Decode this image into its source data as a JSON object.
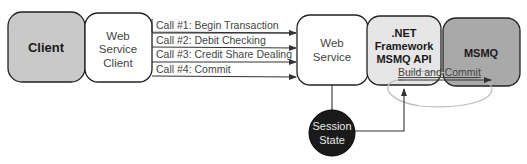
{
  "diagram": {
    "nodes": {
      "client": {
        "label": "Client",
        "fill": "#c9c9c9"
      },
      "ws_client": {
        "line1": "Web",
        "line2": "Service",
        "line3": "Client",
        "fill": "#ffffff"
      },
      "web_service": {
        "line1": "Web",
        "line2": "Service",
        "fill": "#ffffff"
      },
      "net_api": {
        "line1": ".NET",
        "line2": "Framework",
        "line3": "MSMQ API",
        "fill": "#e6e6e6"
      },
      "msmq": {
        "label": "MSMQ",
        "fill": "#a9a9a9"
      },
      "session_state": {
        "line1": "Session",
        "line2": "State",
        "fill": "#1a1a1a"
      }
    },
    "calls": [
      {
        "label": "Call #1: Begin Transaction"
      },
      {
        "label": "Call #2: Debit Checking"
      },
      {
        "label": "Call #3: Credit Share Dealing"
      },
      {
        "label": "Call #4: Commit"
      }
    ],
    "build_commit": {
      "label": "Build and Commit"
    }
  }
}
